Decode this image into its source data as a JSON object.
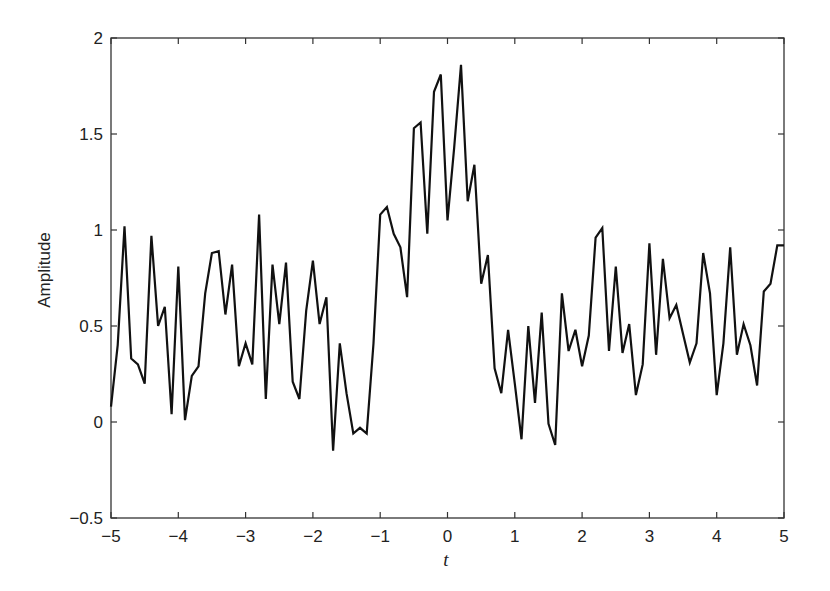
{
  "chart_data": {
    "type": "line",
    "title": "",
    "xlabel": "t",
    "ylabel": "Amplitude",
    "xlim": [
      -5,
      5
    ],
    "ylim": [
      -0.5,
      2
    ],
    "grid": false,
    "legend": null,
    "x_ticks": [
      -5,
      -4,
      -3,
      -2,
      -1,
      0,
      1,
      2,
      3,
      4,
      5
    ],
    "x_tick_labels": [
      "−5",
      "−4",
      "−3",
      "−2",
      "−1",
      "0",
      "1",
      "2",
      "3",
      "4",
      "5"
    ],
    "y_ticks": [
      -0.5,
      0,
      0.5,
      1,
      1.5,
      2
    ],
    "y_tick_labels": [
      "−0.5",
      "0",
      "0.5",
      "1",
      "1.5",
      "2"
    ],
    "series": [
      {
        "name": "signal",
        "color": "#111111",
        "x_start": -5,
        "x_step": 0.1,
        "values": [
          0.08,
          0.4,
          1.02,
          0.33,
          0.3,
          0.2,
          0.97,
          0.5,
          0.6,
          0.04,
          0.81,
          0.01,
          0.24,
          0.29,
          0.67,
          0.88,
          0.89,
          0.56,
          0.82,
          0.29,
          0.41,
          0.3,
          1.08,
          0.12,
          0.82,
          0.51,
          0.83,
          0.21,
          0.12,
          0.58,
          0.84,
          0.51,
          0.65,
          -0.15,
          0.41,
          0.15,
          -0.06,
          -0.03,
          -0.06,
          0.41,
          1.08,
          1.12,
          0.98,
          0.91,
          0.65,
          1.53,
          1.56,
          0.98,
          1.72,
          1.81,
          1.05,
          1.43,
          1.86,
          1.15,
          1.34,
          0.72,
          0.87,
          0.28,
          0.15,
          0.48,
          0.2,
          -0.09,
          0.5,
          0.1,
          0.57,
          -0.01,
          -0.12,
          0.67,
          0.37,
          0.48,
          0.29,
          0.45,
          0.96,
          1.01,
          0.37,
          0.81,
          0.36,
          0.51,
          0.14,
          0.3,
          0.93,
          0.35,
          0.85,
          0.54,
          0.61,
          0.46,
          0.31,
          0.41,
          0.88,
          0.67,
          0.14,
          0.41,
          0.91,
          0.35,
          0.51,
          0.4,
          0.19,
          0.68,
          0.72,
          0.92,
          0.92
        ]
      }
    ]
  }
}
